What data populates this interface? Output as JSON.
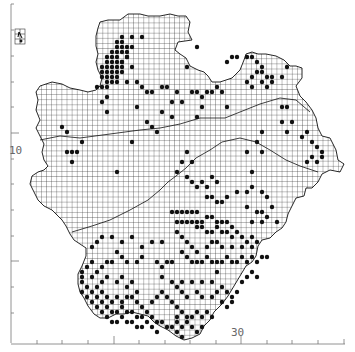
{
  "map": {
    "type": "tetrad distribution map",
    "axis_labels": {
      "left": "10",
      "bottom": "30"
    },
    "colors": {
      "background": "#ffffff",
      "grid": "#222222",
      "dot": "#111111",
      "axis": "#555555"
    },
    "legend_inset": "north-arrow inset",
    "dots": [
      [
        117,
        42
      ],
      [
        122,
        42
      ],
      [
        117,
        47
      ],
      [
        122,
        47
      ],
      [
        127,
        47
      ],
      [
        112,
        52
      ],
      [
        117,
        52
      ],
      [
        122,
        52
      ],
      [
        127,
        52
      ],
      [
        107,
        57
      ],
      [
        112,
        57
      ],
      [
        117,
        57
      ],
      [
        127,
        57
      ],
      [
        107,
        62
      ],
      [
        112,
        62
      ],
      [
        117,
        62
      ],
      [
        122,
        62
      ],
      [
        102,
        67
      ],
      [
        107,
        67
      ],
      [
        112,
        67
      ],
      [
        117,
        67
      ],
      [
        122,
        67
      ],
      [
        102,
        72
      ],
      [
        107,
        72
      ],
      [
        112,
        72
      ],
      [
        117,
        72
      ],
      [
        122,
        72
      ],
      [
        102,
        77
      ],
      [
        107,
        77
      ],
      [
        112,
        77
      ],
      [
        117,
        77
      ],
      [
        107,
        82
      ],
      [
        112,
        82
      ],
      [
        117,
        82
      ],
      [
        97,
        87
      ],
      [
        102,
        87
      ],
      [
        107,
        87
      ],
      [
        107,
        97
      ],
      [
        102,
        102
      ],
      [
        107,
        112
      ],
      [
        122,
        37
      ],
      [
        132,
        37
      ],
      [
        142,
        37
      ],
      [
        122,
        62
      ],
      [
        127,
        57
      ],
      [
        132,
        47
      ],
      [
        132,
        67
      ],
      [
        137,
        82
      ],
      [
        142,
        87
      ],
      [
        147,
        92
      ],
      [
        152,
        92
      ],
      [
        162,
        87
      ],
      [
        167,
        87
      ],
      [
        127,
        82
      ],
      [
        187,
        67
      ],
      [
        197,
        47
      ],
      [
        162,
        112
      ],
      [
        172,
        102
      ],
      [
        177,
        92
      ],
      [
        182,
        102
      ],
      [
        192,
        92
      ],
      [
        197,
        92
      ],
      [
        202,
        97
      ],
      [
        207,
        92
      ],
      [
        212,
        92
      ],
      [
        217,
        87
      ],
      [
        222,
        92
      ],
      [
        227,
        107
      ],
      [
        202,
        107
      ],
      [
        197,
        117
      ],
      [
        172,
        117
      ],
      [
        157,
        132
      ],
      [
        147,
        122
      ],
      [
        137,
        107
      ],
      [
        62,
        127
      ],
      [
        67,
        132
      ],
      [
        67,
        152
      ],
      [
        72,
        152
      ],
      [
        77,
        152
      ],
      [
        82,
        142
      ],
      [
        72,
        162
      ],
      [
        117,
        172
      ],
      [
        132,
        142
      ],
      [
        152,
        127
      ],
      [
        227,
        62
      ],
      [
        232,
        57
      ],
      [
        237,
        57
      ],
      [
        247,
        57
      ],
      [
        252,
        57
      ],
      [
        257,
        62
      ],
      [
        262,
        67
      ],
      [
        257,
        72
      ],
      [
        252,
        77
      ],
      [
        247,
        82
      ],
      [
        252,
        87
      ],
      [
        262,
        72
      ],
      [
        267,
        77
      ],
      [
        272,
        77
      ],
      [
        262,
        82
      ],
      [
        267,
        87
      ],
      [
        272,
        82
      ],
      [
        282,
        77
      ],
      [
        287,
        67
      ],
      [
        282,
        107
      ],
      [
        287,
        107
      ],
      [
        282,
        122
      ],
      [
        292,
        122
      ],
      [
        262,
        132
      ],
      [
        287,
        132
      ],
      [
        302,
        137
      ],
      [
        307,
        132
      ],
      [
        312,
        142
      ],
      [
        317,
        147
      ],
      [
        322,
        152
      ],
      [
        312,
        157
      ],
      [
        307,
        162
      ],
      [
        317,
        162
      ],
      [
        322,
        157
      ],
      [
        247,
        152
      ],
      [
        257,
        142
      ],
      [
        262,
        152
      ],
      [
        252,
        172
      ],
      [
        187,
        152
      ],
      [
        182,
        162
      ],
      [
        192,
        162
      ],
      [
        177,
        172
      ],
      [
        187,
        177
      ],
      [
        192,
        182
      ],
      [
        197,
        187
      ],
      [
        202,
        182
      ],
      [
        207,
        187
      ],
      [
        212,
        177
      ],
      [
        217,
        182
      ],
      [
        207,
        197
      ],
      [
        212,
        197
      ],
      [
        217,
        202
      ],
      [
        222,
        202
      ],
      [
        227,
        197
      ],
      [
        237,
        192
      ],
      [
        247,
        192
      ],
      [
        252,
        187
      ],
      [
        262,
        192
      ],
      [
        267,
        197
      ],
      [
        272,
        207
      ],
      [
        247,
        207
      ],
      [
        257,
        212
      ],
      [
        262,
        212
      ],
      [
        267,
        217
      ],
      [
        252,
        222
      ],
      [
        262,
        222
      ],
      [
        277,
        222
      ],
      [
        172,
        212
      ],
      [
        177,
        212
      ],
      [
        182,
        212
      ],
      [
        187,
        212
      ],
      [
        192,
        212
      ],
      [
        197,
        212
      ],
      [
        177,
        222
      ],
      [
        182,
        222
      ],
      [
        187,
        222
      ],
      [
        192,
        222
      ],
      [
        197,
        222
      ],
      [
        202,
        222
      ],
      [
        207,
        217
      ],
      [
        212,
        217
      ],
      [
        217,
        222
      ],
      [
        222,
        222
      ],
      [
        227,
        222
      ],
      [
        197,
        227
      ],
      [
        202,
        227
      ],
      [
        207,
        232
      ],
      [
        212,
        232
      ],
      [
        217,
        227
      ],
      [
        222,
        232
      ],
      [
        227,
        232
      ],
      [
        232,
        227
      ],
      [
        232,
        237
      ],
      [
        237,
        232
      ],
      [
        242,
        237
      ],
      [
        247,
        242
      ],
      [
        252,
        237
      ],
      [
        257,
        242
      ],
      [
        252,
        247
      ],
      [
        242,
        247
      ],
      [
        232,
        247
      ],
      [
        222,
        247
      ],
      [
        217,
        242
      ],
      [
        212,
        242
      ],
      [
        207,
        247
      ],
      [
        197,
        252
      ],
      [
        192,
        247
      ],
      [
        187,
        242
      ],
      [
        182,
        237
      ],
      [
        177,
        232
      ],
      [
        182,
        252
      ],
      [
        187,
        257
      ],
      [
        192,
        262
      ],
      [
        197,
        262
      ],
      [
        202,
        262
      ],
      [
        207,
        257
      ],
      [
        212,
        262
      ],
      [
        217,
        262
      ],
      [
        222,
        262
      ],
      [
        227,
        257
      ],
      [
        232,
        262
      ],
      [
        237,
        262
      ],
      [
        242,
        257
      ],
      [
        247,
        262
      ],
      [
        252,
        257
      ],
      [
        257,
        262
      ],
      [
        262,
        257
      ],
      [
        267,
        257
      ],
      [
        172,
        262
      ],
      [
        167,
        262
      ],
      [
        162,
        267
      ],
      [
        157,
        262
      ],
      [
        162,
        277
      ],
      [
        172,
        282
      ],
      [
        177,
        287
      ],
      [
        182,
        292
      ],
      [
        187,
        297
      ],
      [
        197,
        292
      ],
      [
        202,
        297
      ],
      [
        212,
        297
      ],
      [
        217,
        292
      ],
      [
        222,
        287
      ],
      [
        227,
        292
      ],
      [
        232,
        297
      ],
      [
        237,
        292
      ],
      [
        242,
        282
      ],
      [
        247,
        277
      ],
      [
        252,
        272
      ],
      [
        257,
        277
      ],
      [
        217,
        272
      ],
      [
        212,
        282
      ],
      [
        202,
        282
      ],
      [
        192,
        282
      ],
      [
        182,
        282
      ],
      [
        142,
        257
      ],
      [
        137,
        262
      ],
      [
        127,
        262
      ],
      [
        122,
        257
      ],
      [
        117,
        252
      ],
      [
        112,
        262
      ],
      [
        107,
        262
      ],
      [
        102,
        267
      ],
      [
        97,
        272
      ],
      [
        92,
        277
      ],
      [
        97,
        287
      ],
      [
        102,
        292
      ],
      [
        107,
        297
      ],
      [
        112,
        302
      ],
      [
        117,
        297
      ],
      [
        122,
        302
      ],
      [
        127,
        297
      ],
      [
        132,
        297
      ],
      [
        137,
        302
      ],
      [
        142,
        307
      ],
      [
        147,
        312
      ],
      [
        152,
        317
      ],
      [
        157,
        322
      ],
      [
        162,
        322
      ],
      [
        167,
        327
      ],
      [
        172,
        327
      ],
      [
        177,
        322
      ],
      [
        182,
        327
      ],
      [
        187,
        322
      ],
      [
        192,
        327
      ],
      [
        197,
        332
      ],
      [
        202,
        327
      ],
      [
        92,
        262
      ],
      [
        87,
        267
      ],
      [
        82,
        272
      ],
      [
        82,
        277
      ],
      [
        82,
        282
      ],
      [
        87,
        287
      ],
      [
        92,
        292
      ],
      [
        97,
        297
      ],
      [
        102,
        302
      ],
      [
        107,
        307
      ],
      [
        112,
        312
      ],
      [
        117,
        312
      ],
      [
        122,
        307
      ],
      [
        127,
        312
      ],
      [
        132,
        312
      ],
      [
        137,
        317
      ],
      [
        142,
        317
      ],
      [
        147,
        322
      ],
      [
        152,
        327
      ],
      [
        157,
        332
      ],
      [
        177,
        317
      ],
      [
        182,
        312
      ],
      [
        187,
        317
      ],
      [
        192,
        317
      ],
      [
        197,
        312
      ],
      [
        202,
        317
      ],
      [
        207,
        312
      ],
      [
        212,
        317
      ],
      [
        222,
        302
      ],
      [
        227,
        307
      ],
      [
        232,
        302
      ],
      [
        87,
        297
      ],
      [
        92,
        302
      ],
      [
        97,
        307
      ],
      [
        102,
        312
      ],
      [
        107,
        317
      ],
      [
        112,
        322
      ],
      [
        117,
        322
      ],
      [
        122,
        317
      ],
      [
        127,
        322
      ],
      [
        132,
        322
      ],
      [
        137,
        327
      ],
      [
        142,
        327
      ],
      [
        177,
        332
      ],
      [
        182,
        337
      ],
      [
        92,
        247
      ],
      [
        97,
        242
      ],
      [
        102,
        237
      ],
      [
        112,
        237
      ],
      [
        122,
        242
      ],
      [
        132,
        237
      ],
      [
        142,
        247
      ],
      [
        152,
        242
      ],
      [
        162,
        242
      ],
      [
        152,
        302
      ],
      [
        157,
        297
      ],
      [
        162,
        292
      ],
      [
        167,
        297
      ],
      [
        172,
        302
      ],
      [
        177,
        307
      ],
      [
        82,
        292
      ],
      [
        137,
        292
      ],
      [
        127,
        287
      ],
      [
        132,
        282
      ],
      [
        117,
        282
      ],
      [
        122,
        277
      ],
      [
        102,
        282
      ],
      [
        107,
        277
      ]
    ]
  }
}
